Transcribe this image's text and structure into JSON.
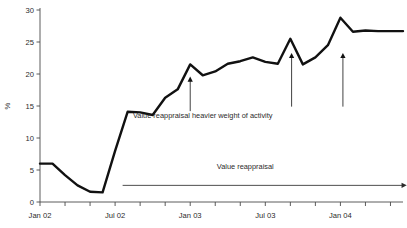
{
  "chart_data": {
    "type": "line",
    "title": "",
    "xlabel": "",
    "ylabel": "%",
    "ylim": [
      0,
      30
    ],
    "y_ticks": [
      0,
      5,
      10,
      15,
      20,
      25,
      30
    ],
    "y_tick_labels": [
      "0",
      "5",
      "10",
      "15",
      "20",
      "25",
      "30"
    ],
    "grid": false,
    "legend": "none",
    "x_tick_labels": [
      "Jan 02",
      "Jul 02",
      "Jan 03",
      "Jul 03",
      "Jan 04"
    ],
    "x_tick_index": [
      0,
      6,
      12,
      18,
      24
    ],
    "x_minor_tick_every_months": 2,
    "x_range_index": [
      0,
      29
    ],
    "line_color": "#111111",
    "line_width": 2.4,
    "x": [
      "Jan 02",
      "Feb 02",
      "Mar 02",
      "Apr 02",
      "May 02",
      "Jun 02",
      "Jul 02",
      "Aug 02",
      "Sep 02",
      "Oct 02",
      "Nov 02",
      "Dec 02",
      "Jan 03",
      "Feb 03",
      "Mar 03",
      "Apr 03",
      "May 03",
      "Jun 03",
      "Jul 03",
      "Aug 03",
      "Sep 03",
      "Oct 03",
      "Nov 03",
      "Dec 03",
      "Jan 04",
      "Feb 04",
      "Mar 04",
      "Apr 04",
      "May 04",
      "Jun 04"
    ],
    "values": [
      6.0,
      6.0,
      4.2,
      2.6,
      1.6,
      1.5,
      8.0,
      14.1,
      14.0,
      13.6,
      16.3,
      17.6,
      21.5,
      19.8,
      20.4,
      21.6,
      22.0,
      22.6,
      21.9,
      21.6,
      25.5,
      21.5,
      22.6,
      24.5,
      28.8,
      26.6,
      26.8,
      26.7,
      26.7,
      26.7
    ],
    "annotations": [
      {
        "name": "value-reappraisal-heavier-weight",
        "text": "Value reappraisal heavier weight of activity",
        "text_x_index": 13.0,
        "text_y_value": 13.2,
        "arrows": [
          {
            "x_index": 12.0,
            "y_start": 14.2,
            "y_end": 19.6
          },
          {
            "x_index": 20.1,
            "y_start": 14.9,
            "y_end": 23.3
          },
          {
            "x_index": 24.2,
            "y_start": 14.9,
            "y_end": 23.3
          }
        ]
      },
      {
        "name": "value-reappraisal-span",
        "text": "Value reappraisal",
        "text_x_index": 16.4,
        "text_y_value": 5.2,
        "span_arrow": {
          "x_start_index": 6.6,
          "x_end_index": 29.3,
          "y_value": 2.6
        }
      }
    ]
  }
}
